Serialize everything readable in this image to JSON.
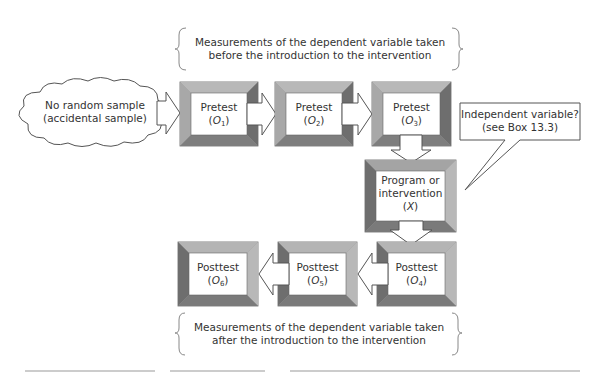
{
  "diagram": {
    "type": "one-group interrupted time-series design flow",
    "top_brace": {
      "line1": "Measurements of the dependent variable taken",
      "line2": "before the introduction to the intervention"
    },
    "bottom_brace": {
      "line1": "Measurements of the dependent variable taken",
      "line2": "after the introduction to the intervention"
    },
    "cloud": {
      "line1": "No random sample",
      "line2": "(accidental sample)"
    },
    "callout": {
      "line1": "Independent variable?",
      "line2": "(see Box 13.3)"
    },
    "nodes": [
      {
        "id": "O1",
        "label": "Pretest",
        "symbol": "O",
        "subscript": "1"
      },
      {
        "id": "O2",
        "label": "Pretest",
        "symbol": "O",
        "subscript": "2"
      },
      {
        "id": "O3",
        "label": "Pretest",
        "symbol": "O",
        "subscript": "3"
      },
      {
        "id": "X",
        "label_line1": "Program or",
        "label_line2": "intervention",
        "symbol": "X"
      },
      {
        "id": "O4",
        "label": "Posttest",
        "symbol": "O",
        "subscript": "4"
      },
      {
        "id": "O5",
        "label": "Posttest",
        "symbol": "O",
        "subscript": "5"
      },
      {
        "id": "O6",
        "label": "Posttest",
        "symbol": "O",
        "subscript": "6"
      }
    ],
    "edges": [
      [
        "cloud",
        "O1"
      ],
      [
        "O1",
        "O2"
      ],
      [
        "O2",
        "O3"
      ],
      [
        "O3",
        "X"
      ],
      [
        "X",
        "O4"
      ],
      [
        "O4",
        "O5"
      ],
      [
        "O5",
        "O6"
      ]
    ],
    "colors": {
      "frame_light": "#b4b4b4",
      "frame_mid": "#9a9a9a",
      "frame_dark": "#6e6e6e",
      "outline": "#555555",
      "text": "#333333"
    }
  }
}
